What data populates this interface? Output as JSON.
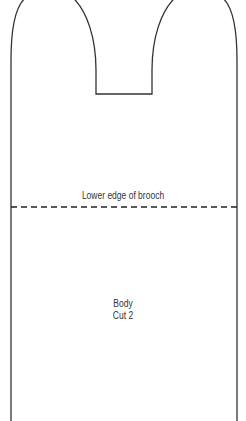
{
  "pattern": {
    "piece_name": "Body",
    "cut_instruction": "Cut 2",
    "fold_line_label": "Lower edge of brooch",
    "outline_color": "#333333",
    "dashed_line_color": "#222222"
  }
}
